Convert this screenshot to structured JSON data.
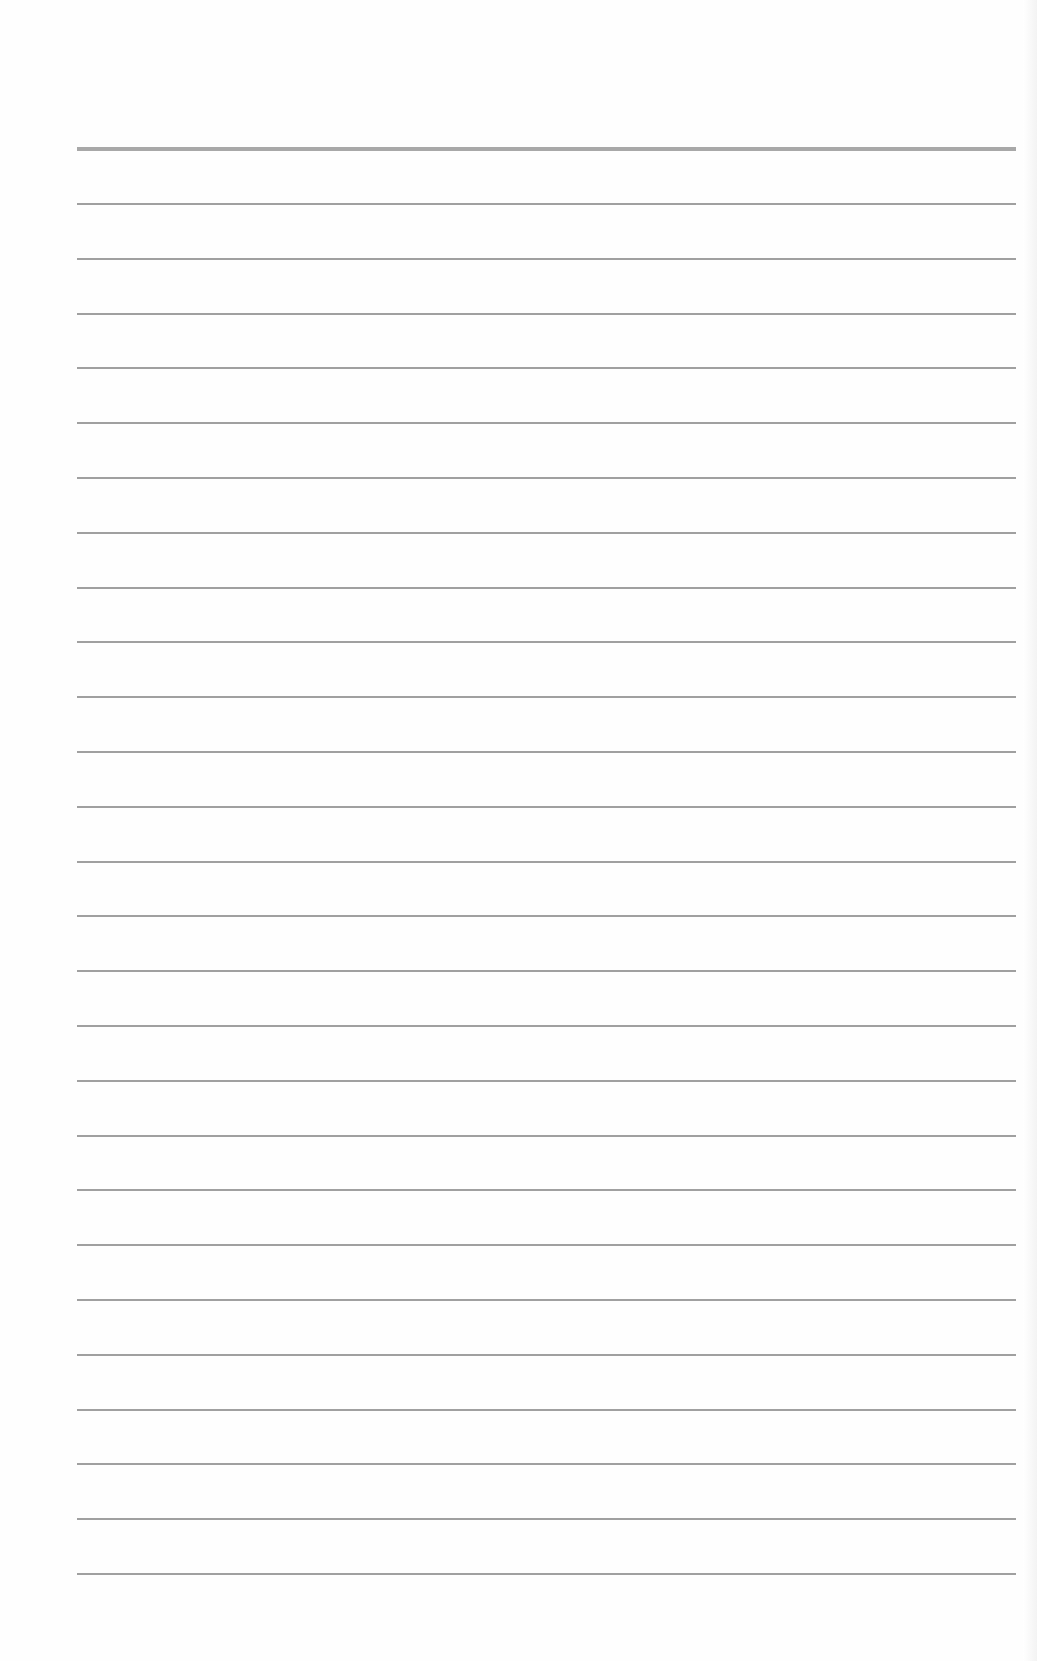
{
  "page": {
    "type": "blank lined paper",
    "background": "#fefefe",
    "line_color": "#a0a0a0",
    "top_rule_color": "#a8a8a8",
    "left_x": 77,
    "right_x": 1016,
    "top_rule_y": 147,
    "first_line_y": 203,
    "line_spacing": 54.8,
    "thin_line_count": 26
  }
}
